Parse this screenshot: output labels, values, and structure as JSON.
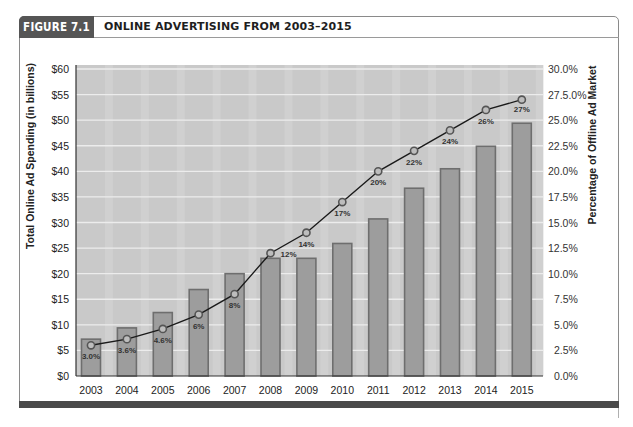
{
  "figure": {
    "label": "FIGURE 7.1",
    "title": "ONLINE ADVERTISING FROM 2003–2015"
  },
  "colors": {
    "header_bg": "#555555",
    "plot_bg": "#c9c9c9",
    "plot_bg_strip": "#d6d6d6",
    "gridline": "#ececec",
    "bar_fill": "#9d9d9d",
    "bar_border": "#6e6e6e",
    "line": "#1a1a1a",
    "marker_fill": "#bdbdbd",
    "marker_stroke": "#555555",
    "bottom_bar": "#4a4a4a"
  },
  "chart_data": {
    "type": "bar",
    "title": "ONLINE ADVERTISING FROM 2003–2015",
    "xlabel": "",
    "ylabel": "Total Online Ad Spending (in billions)",
    "y2label": "Percentage of Offline Ad Market",
    "categories": [
      "2003",
      "2004",
      "2005",
      "2006",
      "2007",
      "2008",
      "2009",
      "2010",
      "2011",
      "2012",
      "2013",
      "2014",
      "2015"
    ],
    "series": [
      {
        "name": "Total Online Ad Spending (in billions)",
        "type": "bar",
        "axis": "left",
        "values": [
          7.2,
          9.4,
          12.4,
          16.9,
          20.0,
          23.0,
          23.0,
          25.9,
          30.7,
          36.7,
          40.5,
          44.9,
          49.4
        ]
      },
      {
        "name": "Percentage of Offline Ad Market",
        "type": "line",
        "axis": "right",
        "values": [
          3.0,
          3.6,
          4.6,
          6,
          8,
          12,
          14,
          17,
          20,
          22,
          24,
          26,
          27
        ],
        "labels": [
          "3.0%",
          "3.6%",
          "4.6%",
          "6%",
          "8%",
          "12%",
          "14%",
          "17%",
          "20%",
          "22%",
          "24%",
          "26%",
          "27%"
        ]
      }
    ],
    "ylim": [
      0,
      60
    ],
    "y2lim": [
      0,
      30
    ],
    "yticks": [
      "$0",
      "$5",
      "$10",
      "$15",
      "$20",
      "$25",
      "$30",
      "$35",
      "$40",
      "$45",
      "$50",
      "$55",
      "$60"
    ],
    "y2ticks": [
      "0.0%",
      "2.5%",
      "5.0%",
      "7.5%",
      "10.0%",
      "12.5%",
      "15.0%",
      "17.5%",
      "20.0%",
      "22.5%",
      "25.0%",
      "27.5.0%",
      "30.0%"
    ],
    "grid": true,
    "legend": "none"
  }
}
